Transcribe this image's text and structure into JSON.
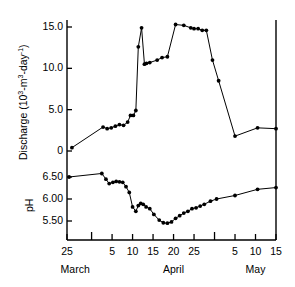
{
  "figure": {
    "background": "#ffffff",
    "ink": "#000000",
    "width": 295,
    "height": 287
  },
  "axes": {
    "discharge": {
      "label_main": "Discharge (10",
      "label_sup1": "3",
      "label_mid": "-m",
      "label_sup2": "3",
      "label_mid2": "-day",
      "label_sup3": "-1",
      "label_end": ")",
      "label_plain": "Discharge (10^3-m^3-day^-1)",
      "ticks": [
        "15.0",
        "10.0",
        "5.0",
        "0"
      ],
      "tick_values": [
        15.0,
        10.0,
        5.0,
        0.0
      ],
      "ylim": [
        0,
        16.5
      ]
    },
    "ph": {
      "label": "pH",
      "ticks": [
        "6.50",
        "6.00",
        "5.50"
      ],
      "tick_values": [
        6.5,
        6.0,
        5.5
      ],
      "ylim": [
        5.3,
        6.65
      ]
    },
    "x": {
      "ticks": [
        "25",
        "5",
        "10",
        "15",
        "20",
        "25",
        "5",
        "10",
        "15"
      ],
      "tick_days": [
        0,
        11,
        16,
        21,
        26,
        31,
        41,
        46,
        51
      ],
      "untitled_ticks": [
        6,
        36
      ],
      "months": [
        "March",
        "April",
        "May"
      ],
      "month_positions": [
        2,
        26,
        46
      ],
      "range": [
        0,
        51
      ]
    }
  },
  "chart_data": {
    "type": "line",
    "title": "",
    "xlabel": "",
    "ylabel": "Discharge (10^3-m^3-day^-1) / pH",
    "grid": false,
    "legend": "none",
    "series": [
      {
        "name": "Discharge",
        "units": "10^3 m^3 day^-1",
        "ylim": [
          0,
          16.5
        ],
        "marker": "filled-circle",
        "x": [
          1.2,
          8.8,
          9.8,
          10.8,
          11.8,
          12.8,
          13.8,
          14.8,
          15.5,
          16.2,
          16.8,
          17.4,
          18.2,
          18.9,
          19.4,
          20.2,
          22.0,
          23.2,
          24.5,
          26.5,
          28.5,
          30.2,
          31.0,
          32.0,
          33.0,
          34.0,
          35.5,
          37.0,
          41.0,
          46.5,
          51.0
        ],
        "y": [
          0.4,
          2.9,
          2.7,
          2.8,
          3.0,
          3.2,
          3.1,
          3.5,
          4.3,
          4.3,
          4.9,
          12.6,
          14.9,
          10.5,
          10.6,
          10.7,
          11.0,
          11.3,
          11.4,
          15.3,
          15.2,
          14.9,
          14.8,
          14.8,
          14.6,
          14.6,
          11.0,
          8.5,
          1.8,
          2.8,
          2.7
        ]
      },
      {
        "name": "pH",
        "units": "pH",
        "ylim": [
          5.3,
          6.65
        ],
        "marker": "filled-circle",
        "x": [
          0.5,
          8.5,
          9.5,
          10.3,
          11.2,
          12.0,
          12.8,
          13.6,
          14.4,
          15.2,
          16.0,
          16.8,
          17.4,
          18.0,
          18.6,
          19.3,
          20.2,
          21.2,
          22.5,
          23.5,
          24.5,
          25.5,
          26.5,
          27.5,
          28.5,
          29.5,
          30.5,
          31.5,
          32.5,
          33.5,
          35.0,
          36.5,
          41.0,
          46.5,
          51.0
        ],
        "y": [
          6.5,
          6.58,
          6.45,
          6.35,
          6.38,
          6.4,
          6.39,
          6.38,
          6.28,
          6.15,
          5.82,
          5.72,
          5.85,
          5.9,
          5.88,
          5.82,
          5.78,
          5.65,
          5.52,
          5.46,
          5.45,
          5.48,
          5.56,
          5.62,
          5.68,
          5.72,
          5.78,
          5.8,
          5.84,
          5.88,
          5.95,
          6.0,
          6.08,
          6.22,
          6.26
        ]
      }
    ]
  }
}
